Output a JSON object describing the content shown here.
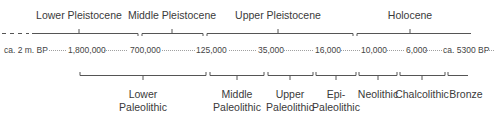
{
  "geologic_epochs": [
    {
      "label": "Lower Pleistocene",
      "x": 79
    },
    {
      "label": "Middle Pleistocene",
      "x": 172
    },
    {
      "label": "Upper Pleistocene",
      "x": 278
    },
    {
      "label": "Holocene",
      "x": 410
    }
  ],
  "dates": [
    {
      "label": "ca. 2 m. BP",
      "x": 4
    },
    {
      "label": "1,800,000",
      "x": 68
    },
    {
      "label": "700,000",
      "x": 130
    },
    {
      "label": "125,000",
      "x": 196
    },
    {
      "label": "35,000",
      "x": 258
    },
    {
      "label": "16,000",
      "x": 315
    },
    {
      "label": "10,000",
      "x": 361
    },
    {
      "label": "6,000",
      "x": 406
    },
    {
      "label": "ca. 5300 BP",
      "x": 443
    }
  ],
  "archaeological_periods": [
    {
      "line1": "Lower",
      "line2": "Paleolithic",
      "x": 143
    },
    {
      "line1": "Middle",
      "line2": "Paleolithic",
      "x": 237
    },
    {
      "line1": "Upper",
      "line2": "Paleolithic",
      "x": 290
    },
    {
      "line1": "Epi-",
      "line2": "Paleolithic",
      "x": 336
    },
    {
      "line1": "Neolithic",
      "line2": "",
      "x": 378
    },
    {
      "line1": "Chalcolithic",
      "line2": "",
      "x": 422
    },
    {
      "line1": "Bronze",
      "line2": "",
      "x": 460
    }
  ],
  "colors": {
    "line": "#555555",
    "dots": "#888888",
    "text": "#3a3a3a"
  }
}
